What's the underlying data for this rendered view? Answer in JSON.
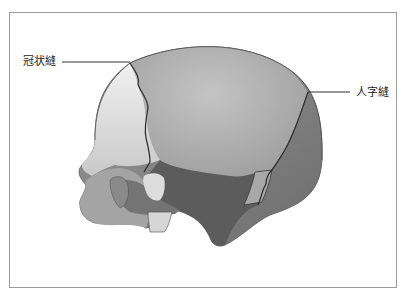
{
  "figure": {
    "labels": {
      "coronal_suture": "冠状縫",
      "lambdoid_suture": "人字縫"
    },
    "colors": {
      "frame_border": "#9a9a9a",
      "frontal_bone": "#e2e2e2",
      "parietal_bone": "#a9a9a9",
      "occipital_bone": "#7a7a7a",
      "temporal_region": "#5f5f5f",
      "face_region": "#9c9c9c",
      "suture_line": "#2a2a2a",
      "leader_line": "#333333",
      "label_text": "#222222"
    }
  }
}
